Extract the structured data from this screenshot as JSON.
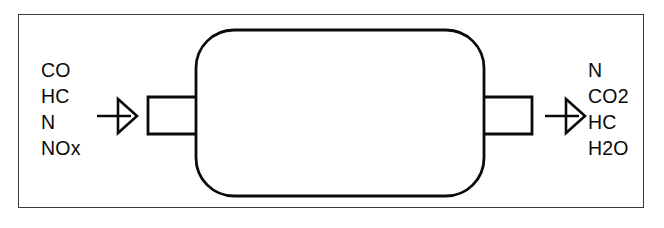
{
  "diagram": {
    "frame": {
      "name": "outer-border",
      "stroke_color": "#3a3a40"
    },
    "stroke_color": "#0a0a0a",
    "background_color": "#ffffff",
    "inlet": {
      "arrow_name": "inlet-flow-arrow",
      "pipe_name": "inlet-pipe",
      "label_group": "inlet-gas-labels",
      "species": [
        {
          "formula": "CO"
        },
        {
          "formula": "HC"
        },
        {
          "formula": "N"
        },
        {
          "formula": "NOx"
        }
      ]
    },
    "converter_body": {
      "name": "catalytic-converter-body",
      "shape": "rounded-rectangle"
    },
    "outlet": {
      "arrow_name": "outlet-flow-arrow",
      "pipe_name": "outlet-pipe",
      "label_group": "outlet-gas-labels",
      "species": [
        {
          "formula": "N"
        },
        {
          "formula": "CO2"
        },
        {
          "formula": "HC"
        },
        {
          "formula": "H2O"
        }
      ]
    }
  }
}
